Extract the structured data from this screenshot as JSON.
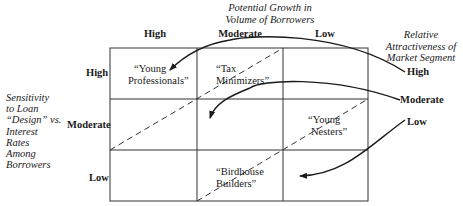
{
  "top_axis": {
    "title_line1": "Potential Growth in",
    "title_line2": "Volume of Borrowers",
    "columns": [
      "High",
      "Moderate",
      "Low"
    ]
  },
  "left_axis": {
    "title_lines": [
      "Sensitivity",
      "to Loan",
      "“Design” vs.",
      "Interest",
      "Rates",
      "Among",
      "Borrowers"
    ],
    "rows": [
      "High",
      "Moderate",
      "Low"
    ]
  },
  "right_legend": {
    "title_lines": [
      "Relative",
      "Attractiveness of",
      "Market Segment"
    ],
    "levels": [
      "High",
      "Moderate",
      "Low"
    ]
  },
  "segments": {
    "young_professionals": {
      "line1": "“Young",
      "line2": "Professionals”"
    },
    "tax_minimizers": {
      "line1": "“Tax",
      "line2": "Minimizers”"
    },
    "young_nesters": {
      "line1": "“Young",
      "line2": "Nesters”"
    },
    "birdhouse_builders": {
      "line1": "“Birdhouse",
      "line2": "Builders”"
    }
  }
}
